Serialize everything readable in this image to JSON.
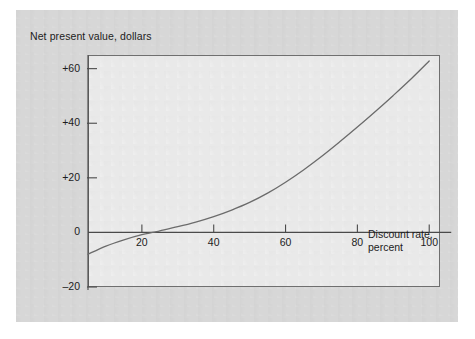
{
  "figure": {
    "panel_color": "#d5d5d5",
    "plot_background_color": "#e9e9e9",
    "frame_color": "#6f6f6f",
    "curve_color": "#6b6b6b",
    "axis_color": "#4a4a4a",
    "text_color": "#1c1c1c"
  },
  "chart_data": {
    "type": "line",
    "title": "",
    "subtitle": "",
    "ylabel": "Net present value, dollars",
    "xlabel_line1": "Discount rate,",
    "xlabel_line2": "percent",
    "xlabel": "Discount rate, percent",
    "xlim": [
      5,
      103
    ],
    "ylim": [
      -20,
      65
    ],
    "xticks": [
      20,
      40,
      60,
      80,
      100
    ],
    "xtick_labels": [
      "20",
      "40",
      "60",
      "80",
      "100"
    ],
    "yticks": [
      -20,
      0,
      20,
      40,
      60
    ],
    "ytick_labels": [
      "-20",
      "0",
      "+20",
      "+40",
      "+60"
    ],
    "grid": false,
    "legend": null,
    "legend_position": "none",
    "annotations": [],
    "zero_crossing_x": 23,
    "series": [
      {
        "name": "Net present value",
        "x": [
          5,
          10,
          15,
          20,
          23,
          25,
          30,
          35,
          40,
          45,
          50,
          55,
          60,
          65,
          70,
          75,
          80,
          85,
          90,
          95,
          100
        ],
        "values": [
          -8.0,
          -5.0,
          -2.7,
          -0.8,
          0.0,
          0.6,
          2.1,
          3.8,
          5.8,
          8.2,
          11.0,
          14.4,
          18.4,
          22.9,
          27.8,
          33.1,
          38.6,
          44.3,
          50.2,
          56.3,
          62.8
        ]
      }
    ]
  }
}
